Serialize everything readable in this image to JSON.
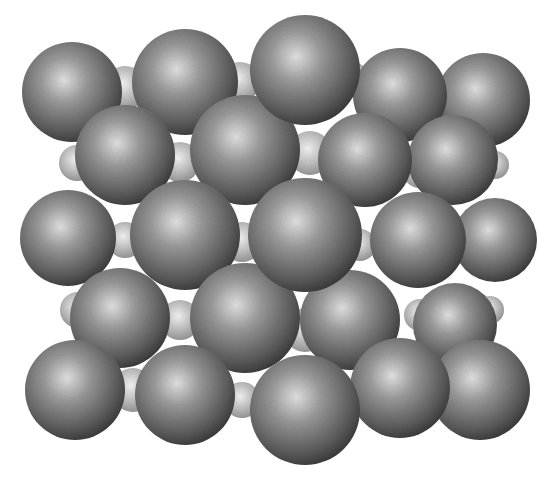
{
  "image": {
    "description": "Crystal lattice model: large dark gray spheres packed with small light gray spheres in the interstitial sites",
    "background": "#ffffff",
    "large_sphere": {
      "highlight": "#e6e6e6",
      "mid": "#8c8c8c",
      "shadow": "#3a3a3a"
    },
    "small_sphere": {
      "highlight": "#f2f2f2",
      "mid": "#bdbdbd",
      "shadow": "#8a8a8a"
    }
  },
  "small_spheres": [
    [
      125,
      88,
      22
    ],
    [
      240,
      82,
      20
    ],
    [
      352,
      80,
      18
    ],
    [
      310,
      153,
      22
    ],
    [
      77,
      163,
      18
    ],
    [
      180,
      162,
      20
    ],
    [
      420,
      170,
      18
    ],
    [
      125,
      240,
      18
    ],
    [
      242,
      242,
      20
    ],
    [
      360,
      245,
      16
    ],
    [
      78,
      310,
      18
    ],
    [
      180,
      320,
      20
    ],
    [
      305,
      330,
      22
    ],
    [
      420,
      315,
      16
    ],
    [
      133,
      390,
      22
    ],
    [
      242,
      400,
      18
    ],
    [
      360,
      400,
      16
    ],
    [
      490,
      310,
      14
    ],
    [
      495,
      165,
      14
    ]
  ],
  "large_spheres": [
    [
      483,
      100,
      47
    ],
    [
      400,
      95,
      47
    ],
    [
      72,
      92,
      50
    ],
    [
      185,
      82,
      53
    ],
    [
      453,
      160,
      45
    ],
    [
      365,
      160,
      47
    ],
    [
      125,
      155,
      50
    ],
    [
      245,
      150,
      55
    ],
    [
      495,
      240,
      42
    ],
    [
      418,
      240,
      48
    ],
    [
      68,
      238,
      48
    ],
    [
      185,
      235,
      55
    ],
    [
      455,
      325,
      42
    ],
    [
      350,
      320,
      50
    ],
    [
      120,
      318,
      50
    ],
    [
      245,
      318,
      55
    ],
    [
      480,
      390,
      50
    ],
    [
      400,
      388,
      50
    ],
    [
      75,
      390,
      50
    ],
    [
      185,
      395,
      50
    ],
    [
      305,
      70,
      55
    ],
    [
      305,
      235,
      57
    ],
    [
      305,
      410,
      55
    ]
  ]
}
